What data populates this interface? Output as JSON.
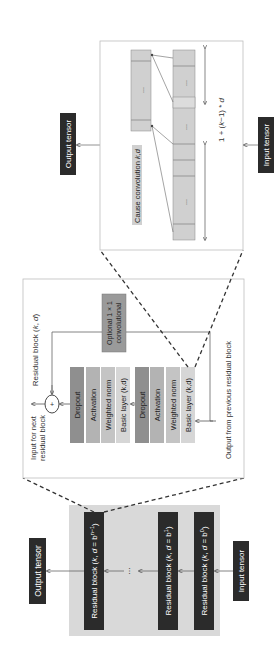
{
  "diagram": {
    "orientation": "rotated-90-ccw",
    "colors": {
      "background": "#ffffff",
      "dark_block": "#2b2b2b",
      "dark_text": "#ffffff",
      "gray_panel": "#d9d9d9",
      "panel_border": "#bdbdbd",
      "dropout": "#8f8f8f",
      "activation": "#b3b3b3",
      "weighted_norm": "#c4c4c4",
      "basic_layer": "#d6d6d6",
      "optional_conv": "#9a9a9a",
      "conv_cell": "#d0d0d0",
      "line": "#555555",
      "dashed": "#333333"
    },
    "stack_panel": {
      "output_tensor": "Output tensor",
      "input_tensor": "Input tensor",
      "ellipsis": "...",
      "blocks": [
        {
          "label": "Residual block (k, d = b^(n−1))",
          "prefix": "Residual block (",
          "k": "k",
          "sep": ", ",
          "d": "d",
          "eq": " = b",
          "exp": "n−1",
          "close": ")"
        },
        {
          "label": "Residual block (k, d = b^1)",
          "prefix": "Residual block (",
          "k": "k",
          "sep": ", ",
          "d": "d",
          "eq": " = b",
          "exp": "1",
          "close": ")"
        },
        {
          "label": "Residual block (k, d = b^0)",
          "prefix": "Residual block (",
          "k": "k",
          "sep": ", ",
          "d": "d",
          "eq": " = b",
          "exp": "0",
          "close": ")"
        }
      ]
    },
    "residual_panel": {
      "title": "Residual block (k, d)",
      "input_for_next_line1": "Input for next",
      "input_for_next_line2": "residual block",
      "output_from_previous": "Output from previous residual block",
      "plus_symbol": "+",
      "optional_conv_line1": "Optional 1 × 1",
      "optional_conv_line2": "convolutional",
      "upper_stack": [
        "Dropout",
        "Activation",
        "Weighted norm",
        "Basic layer (k,d)"
      ],
      "lower_stack": [
        "Dropout",
        "Activation",
        "Weighted norm",
        "Basic layer (k,d)"
      ]
    },
    "causal_panel": {
      "title": "Cause convolution k,d",
      "output_tensor": "Output tensor",
      "input_tensor": "Input tensor",
      "receptive_field": "1 + (k−1) * d",
      "ellipsis": "..."
    }
  }
}
